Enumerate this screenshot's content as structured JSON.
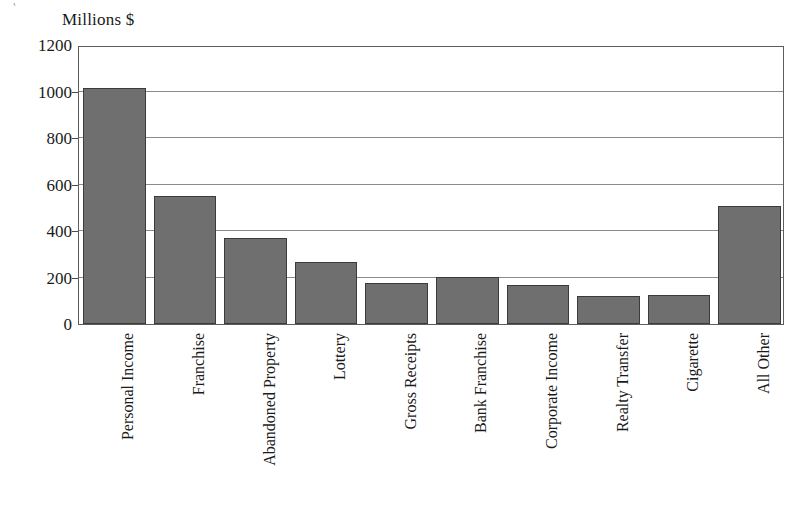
{
  "chart_data": {
    "type": "bar",
    "title": "",
    "subtitle": "",
    "xlabel": "",
    "ylabel": "Millions $",
    "ylim": [
      0,
      1200
    ],
    "yticks": [
      0,
      200,
      400,
      600,
      800,
      1000,
      1200
    ],
    "ytick_labels": [
      "0",
      "200",
      "400",
      "600",
      "800",
      "1000",
      "1200"
    ],
    "grid": true,
    "legend": null,
    "legend_position": "none",
    "orientation": "vertical",
    "bar_color": "#6f6f6f",
    "bar_edge_color": "#3b3b3b",
    "categories": [
      "Personal Income",
      "Franchise",
      "Abandoned Property",
      "Lottery",
      "Gross Receipts",
      "Bank Franchise",
      "Corporate Income",
      "Realty Transfer",
      "Cigarette",
      "All Other"
    ],
    "values": [
      1015,
      550,
      372,
      268,
      178,
      202,
      168,
      120,
      126,
      508
    ]
  },
  "figure": {
    "axis_title": "Millions $",
    "scan_artifact": "'"
  }
}
